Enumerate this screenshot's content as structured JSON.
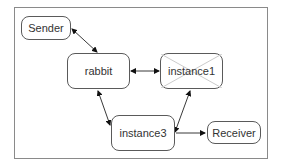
{
  "diagram": {
    "nodes": [
      {
        "id": "sender",
        "label": "Sender",
        "crossed": false
      },
      {
        "id": "rabbit",
        "label": "rabbit",
        "crossed": false
      },
      {
        "id": "instance1",
        "label": "instance1",
        "crossed": true
      },
      {
        "id": "instance3",
        "label": "instance3",
        "crossed": false
      },
      {
        "id": "receiver",
        "label": "Receiver",
        "crossed": false
      }
    ],
    "edges": [
      {
        "from": "sender",
        "to": "rabbit",
        "bidirectional": true
      },
      {
        "from": "rabbit",
        "to": "instance1",
        "bidirectional": true
      },
      {
        "from": "rabbit",
        "to": "instance3",
        "bidirectional": true
      },
      {
        "from": "instance3",
        "to": "instance1",
        "bidirectional": true
      },
      {
        "from": "instance3",
        "to": "receiver",
        "bidirectional": false
      }
    ],
    "colors": {
      "border": "#5a5a5a",
      "frame": "#8a8a8a",
      "cross": "#c8c8c8",
      "text": "#333333"
    }
  }
}
